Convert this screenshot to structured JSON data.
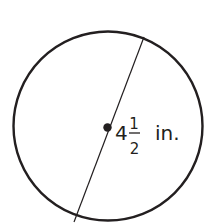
{
  "diagram": {
    "shape": "circle",
    "measurement": {
      "segment": "diameter",
      "whole": "4",
      "numerator": "1",
      "denominator": "2",
      "unit": "in."
    },
    "colors": {
      "stroke": "#231f20",
      "background": "#ffffff"
    }
  }
}
